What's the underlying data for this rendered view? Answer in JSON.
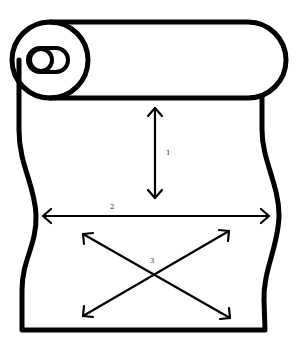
{
  "diagram": {
    "colors": {
      "stroke": "#000000",
      "background": "#ffffff",
      "label": "#333333"
    },
    "labels": {
      "vertical": "1",
      "horizontal": "2",
      "diagonal": "3"
    },
    "elements": [
      {
        "id": "roll",
        "type": "cylinder-roll"
      },
      {
        "id": "sheet",
        "type": "paper-sheet-wavy-edges"
      },
      {
        "id": "arrow-1",
        "type": "double-arrow",
        "direction": "vertical",
        "label": "1"
      },
      {
        "id": "arrow-2",
        "type": "double-arrow",
        "direction": "horizontal",
        "label": "2"
      },
      {
        "id": "arrow-3",
        "type": "double-arrow-cross",
        "direction": "diagonal",
        "label": "3"
      }
    ]
  }
}
